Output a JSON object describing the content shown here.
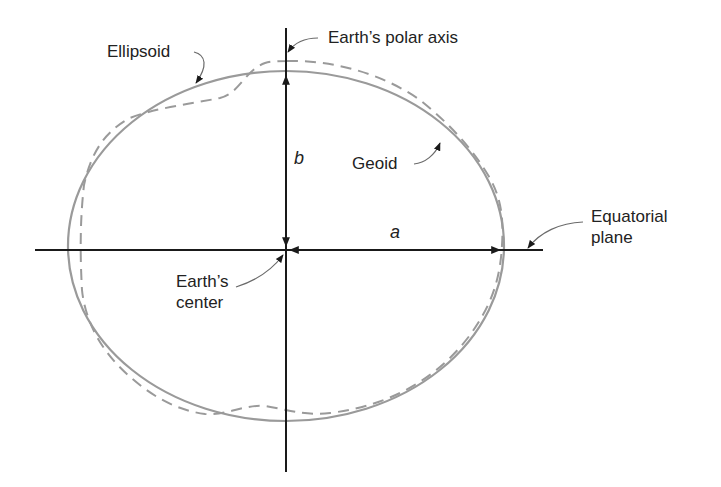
{
  "diagram": {
    "labels": {
      "ellipsoid": "Ellipsoid",
      "polar_axis": "Earth’s polar axis",
      "geoid": "Geoid",
      "equatorial_line1": "Equatorial",
      "equatorial_line2": "plane",
      "center_line1": "Earth’s",
      "center_line2": "center",
      "semi_minor": "b",
      "semi_major": "a"
    },
    "colors": {
      "axis": "#1a1a1a",
      "ellipsoid": "#9a9a9a",
      "geoid": "#9a9a9a",
      "leader": "#6a6a6a",
      "text": "#222222"
    }
  }
}
